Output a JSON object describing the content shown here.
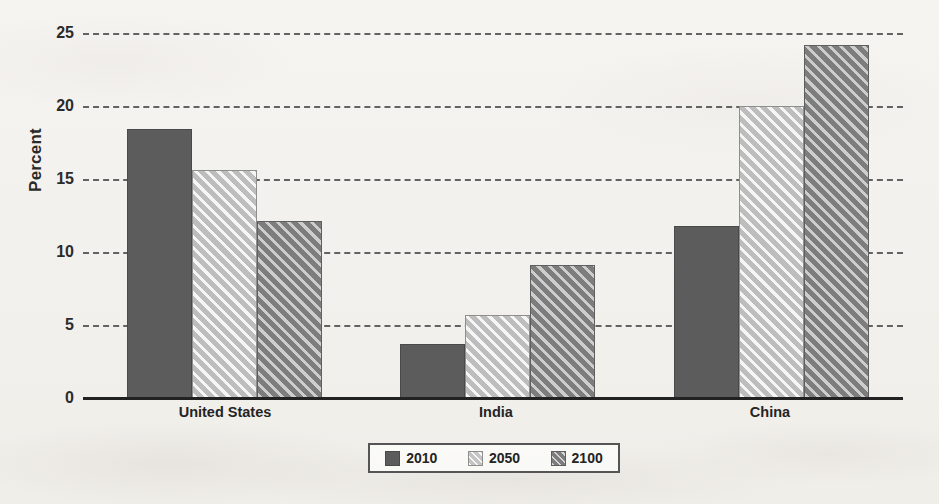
{
  "chart_data": {
    "type": "bar",
    "title": "",
    "subtitle": "",
    "xlabel": "",
    "ylabel": "Percent",
    "ylim": [
      0,
      25
    ],
    "ytick_values": [
      0,
      5,
      10,
      15,
      20,
      25
    ],
    "ytick_labels": [
      "0",
      "5",
      "10",
      "15",
      "20",
      "25"
    ],
    "grid": true,
    "grid_style": "dashed-horizontal",
    "legend_position": "bottom-center",
    "categories": [
      "United States",
      "India",
      "China"
    ],
    "series": [
      {
        "name": "2010",
        "values": [
          18.4,
          3.7,
          11.8
        ],
        "color": "#5c5c5c",
        "pattern": "solid"
      },
      {
        "name": "2050",
        "values": [
          15.6,
          5.7,
          20.0
        ],
        "color": "#bdbdbd",
        "pattern": "diagonal-hatch"
      },
      {
        "name": "2100",
        "values": [
          12.1,
          9.1,
          24.2
        ],
        "color": "#7d7d7d",
        "pattern": "diagonal-hatch"
      }
    ]
  },
  "axes": {
    "y_title": "Percent",
    "y_ticks": [
      "25",
      "20",
      "15",
      "10",
      "5",
      "0"
    ],
    "x_labels": [
      "United States",
      "India",
      "China"
    ]
  },
  "legend": {
    "entries": [
      {
        "label": "2010",
        "swatch": "swatch-solid-dark"
      },
      {
        "label": "2050",
        "swatch": "swatch-hatch-light"
      },
      {
        "label": "2100",
        "swatch": "swatch-hatch-medium"
      }
    ]
  },
  "colors": {
    "series_2010": "#5c5c5c",
    "series_2050": "#bdbdbd",
    "series_2100": "#7d7d7d",
    "gridline": "#4a4a4a",
    "axis": "#222222",
    "background": "#f4f2ef"
  }
}
